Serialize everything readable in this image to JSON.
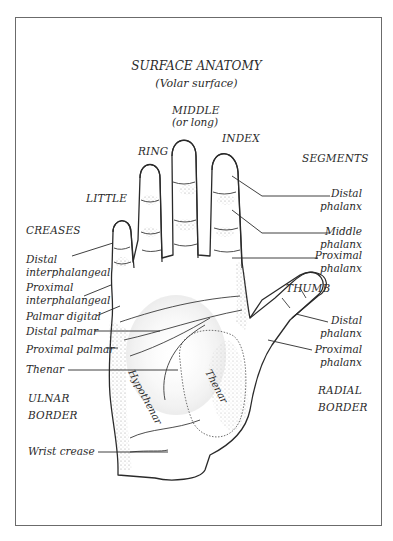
{
  "header": {
    "running_head": "2    Anatomy"
  },
  "figure": {
    "title": "SURFACE ANATOMY",
    "subtitle": "(Volar surface)",
    "fingers": {
      "middle": "MIDDLE",
      "middle_alt": "(or long)",
      "index": "INDEX",
      "ring": "RING",
      "little": "LITTLE",
      "thumb": "THUMB"
    },
    "segments": {
      "heading": "SEGMENTS",
      "items": [
        {
          "line1": "Distal",
          "line2": "phalanx"
        },
        {
          "line1": "Middle",
          "line2": "phalanx"
        },
        {
          "line1": "Proximal",
          "line2": "phalanx"
        }
      ],
      "thumb_items": [
        {
          "line1": "Distal",
          "line2": "phalanx"
        },
        {
          "line1": "Proximal",
          "line2": "phalanx"
        }
      ]
    },
    "creases": {
      "heading": "CREASES",
      "items": [
        {
          "line1": "Distal",
          "line2": "interphalangeal"
        },
        {
          "line1": "Proximal",
          "line2": "interphalangeal"
        },
        {
          "line1": "Palmar digital"
        },
        {
          "line1": "Distal palmar"
        },
        {
          "line1": "Proximal palmar"
        },
        {
          "line1": "Thenar"
        }
      ],
      "wrist": "Wrist crease"
    },
    "regions": {
      "hypothenar": "Hypothenar",
      "thenar": "Thenar"
    },
    "borders": {
      "ulnar_1": "ULNAR",
      "ulnar_2": "BORDER",
      "radial_1": "RADIAL",
      "radial_2": "BORDER"
    },
    "colors": {
      "ink": "#2a2a2a",
      "frame": "#6b6b6b",
      "stipple": "#9a9a9a"
    }
  }
}
